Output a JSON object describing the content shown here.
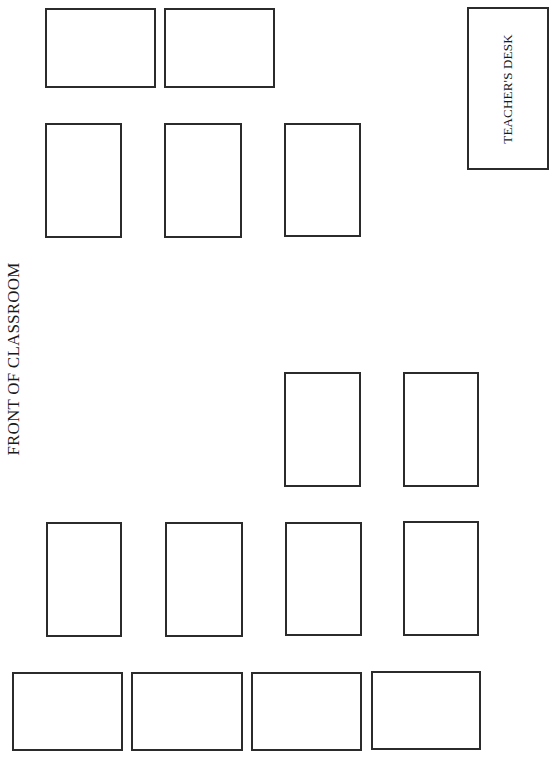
{
  "labels": {
    "front": "FRONT OF CLASSROOM",
    "teacher_desk": "TEACHER'S DESK"
  },
  "colors": {
    "stroke": "#2b2b2b",
    "background": "#ffffff",
    "text": "#1a1a1a"
  },
  "teacher_desk": {
    "x": 467,
    "y": 7,
    "w": 82,
    "h": 163
  },
  "desks": [
    {
      "id": "desk-1",
      "x": 45,
      "y": 8,
      "w": 111,
      "h": 80
    },
    {
      "id": "desk-2",
      "x": 164,
      "y": 8,
      "w": 111,
      "h": 80
    },
    {
      "id": "desk-3",
      "x": 45,
      "y": 123,
      "w": 77,
      "h": 115
    },
    {
      "id": "desk-4",
      "x": 164,
      "y": 123,
      "w": 78,
      "h": 115
    },
    {
      "id": "desk-5",
      "x": 284,
      "y": 123,
      "w": 77,
      "h": 114
    },
    {
      "id": "desk-6",
      "x": 284,
      "y": 372,
      "w": 77,
      "h": 115
    },
    {
      "id": "desk-7",
      "x": 403,
      "y": 372,
      "w": 76,
      "h": 115
    },
    {
      "id": "desk-8",
      "x": 46,
      "y": 522,
      "w": 76,
      "h": 115
    },
    {
      "id": "desk-9",
      "x": 165,
      "y": 522,
      "w": 78,
      "h": 115
    },
    {
      "id": "desk-10",
      "x": 285,
      "y": 522,
      "w": 77,
      "h": 114
    },
    {
      "id": "desk-11",
      "x": 403,
      "y": 521,
      "w": 76,
      "h": 115
    },
    {
      "id": "desk-12",
      "x": 12,
      "y": 672,
      "w": 111,
      "h": 79
    },
    {
      "id": "desk-13",
      "x": 131,
      "y": 672,
      "w": 112,
      "h": 79
    },
    {
      "id": "desk-14",
      "x": 251,
      "y": 672,
      "w": 111,
      "h": 79
    },
    {
      "id": "desk-15",
      "x": 371,
      "y": 671,
      "w": 110,
      "h": 79
    }
  ]
}
